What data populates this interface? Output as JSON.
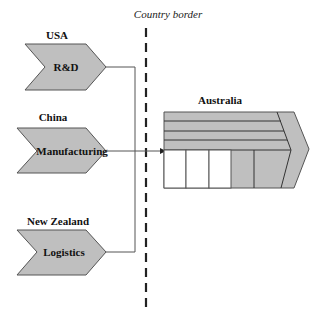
{
  "diagram": {
    "border_caption": "Country border",
    "sources": [
      {
        "country": "USA",
        "activity": "R&D"
      },
      {
        "country": "China",
        "activity": "Manufacturing"
      },
      {
        "country": "New Zealand",
        "activity": "Logistics"
      }
    ],
    "destination": {
      "country": "Australia"
    },
    "colors": {
      "fill": "#bfbfbf",
      "stroke": "#555555",
      "background": "#ffffff"
    }
  }
}
